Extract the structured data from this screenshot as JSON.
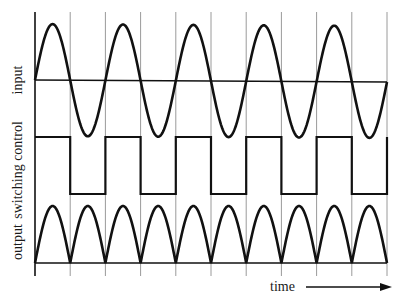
{
  "figure": {
    "labels": {
      "input": "input",
      "switching_control": "switching control",
      "output": "output",
      "time": "time"
    },
    "colors": {
      "trace": "#111111",
      "gridline": "#9a9a9a",
      "background": "#ffffff"
    },
    "layout": {
      "x_start": 35,
      "x_end": 387,
      "half_period_px": 35.2,
      "gridline_count": 11,
      "grid_top": 12,
      "grid_bottom": 276,
      "input_baseline_y": 80,
      "input_amplitude": 56,
      "switch_high_y": 137,
      "switch_low_y": 194,
      "output_baseline_y": 263,
      "output_amplitude": 57
    }
  },
  "chart_data": {
    "type": "line",
    "title": "",
    "xlabel": "time",
    "ylabel": "",
    "grid": "vertical lines at every half-period (zero crossings)",
    "series": [
      {
        "name": "input",
        "shape": "sine",
        "cycles": 5,
        "description": "full sine wave starting at zero, rising first"
      },
      {
        "name": "switching control",
        "shape": "square",
        "half_periods": 10,
        "values": [
          1,
          0,
          1,
          0,
          1,
          0,
          1,
          0,
          1,
          0
        ],
        "description": "high during positive half-cycles, low during negative half-cycles"
      },
      {
        "name": "output",
        "shape": "full-wave rectified sine",
        "humps": 10,
        "description": "|sin| — each half-cycle appears as a positive hump"
      }
    ]
  }
}
